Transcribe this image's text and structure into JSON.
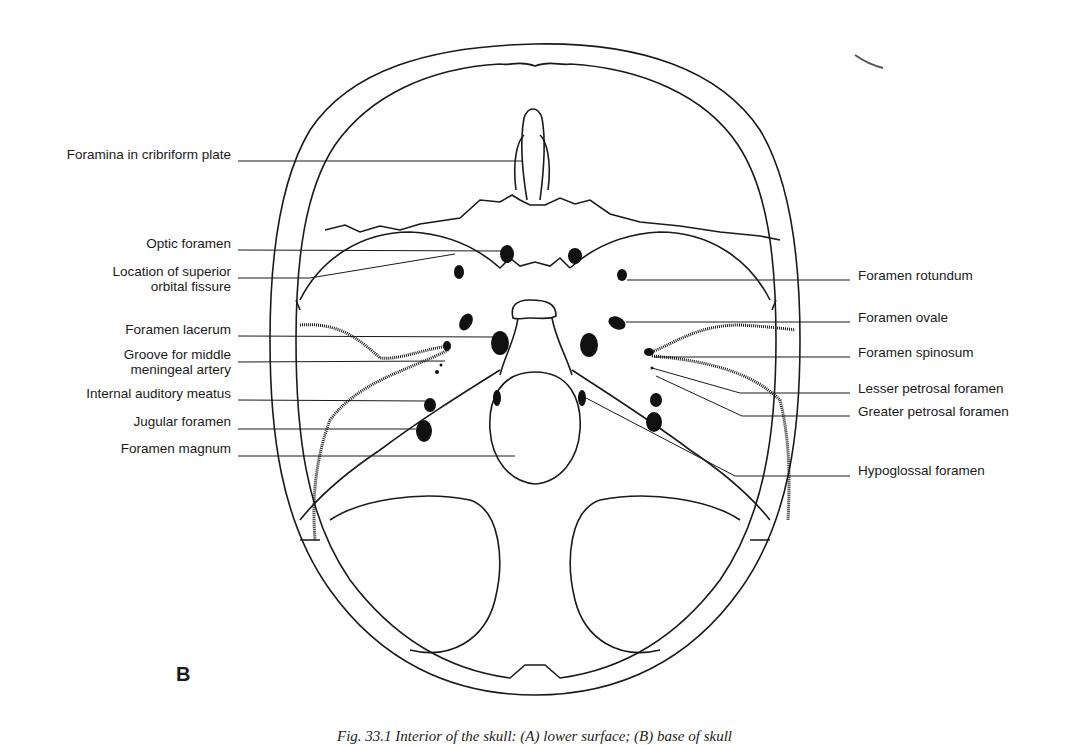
{
  "figure": {
    "panel_letter": "B",
    "caption": "Fig. 33.1 Interior of the skull: (A) lower surface; (B) base of skull"
  },
  "labels": {
    "left": [
      {
        "text": "Foramina in cribriform plate",
        "y": 155
      },
      {
        "text": "Optic foramen",
        "y": 243
      },
      {
        "text": "Location of superior\norbital fissure",
        "y": 269
      },
      {
        "text": "Foramen lacerum",
        "y": 329
      },
      {
        "text": "Groove for middle\nmeningeal artery",
        "y": 355
      },
      {
        "text": "Internal auditory meatus",
        "y": 393
      },
      {
        "text": "Jugular foramen",
        "y": 421
      },
      {
        "text": "Foramen magnum",
        "y": 448
      }
    ],
    "right": [
      {
        "text": "Foramen rotundum",
        "y": 275
      },
      {
        "text": "Foramen ovale",
        "y": 317
      },
      {
        "text": "Foramen spinosum",
        "y": 352
      },
      {
        "text": "Lesser petrosal foramen",
        "y": 388
      },
      {
        "text": "Greater petrosal foramen",
        "y": 411
      },
      {
        "text": "Hypoglossal foramen",
        "y": 470
      }
    ]
  },
  "colors": {
    "line": "#1a1a1a",
    "background": "#ffffff",
    "foramen_fill": "#111111"
  }
}
